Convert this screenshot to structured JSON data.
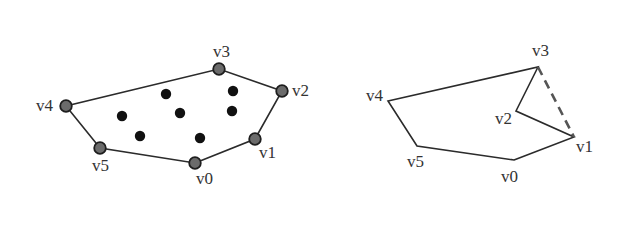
{
  "colors": {
    "edge": "#2b2b2b",
    "vertex_fill": "#6b6b6b",
    "vertex_stroke": "#1e1e1e",
    "interior_point": "#111111",
    "label": "#333333"
  },
  "left_polygon": {
    "vertices": [
      {
        "label": "v0",
        "x": 195,
        "y": 163,
        "lx": 196,
        "ly": 184
      },
      {
        "label": "v1",
        "x": 255,
        "y": 139,
        "lx": 259,
        "ly": 158
      },
      {
        "label": "v2",
        "x": 282,
        "y": 91,
        "lx": 292,
        "ly": 96
      },
      {
        "label": "v3",
        "x": 219,
        "y": 69,
        "lx": 213,
        "ly": 57
      },
      {
        "label": "v4",
        "x": 66,
        "y": 106,
        "lx": 36,
        "ly": 111
      },
      {
        "label": "v5",
        "x": 100,
        "y": 148,
        "lx": 92,
        "ly": 171
      }
    ],
    "interior_points": [
      {
        "x": 166,
        "y": 94
      },
      {
        "x": 233,
        "y": 91
      },
      {
        "x": 122,
        "y": 116
      },
      {
        "x": 180,
        "y": 113
      },
      {
        "x": 232,
        "y": 111
      },
      {
        "x": 140,
        "y": 136
      },
      {
        "x": 200,
        "y": 138
      }
    ]
  },
  "right_polygon": {
    "vertices": [
      {
        "label": "v0",
        "x": 514,
        "y": 160,
        "lx": 501,
        "ly": 182
      },
      {
        "label": "v1",
        "x": 574,
        "y": 137,
        "lx": 576,
        "ly": 152
      },
      {
        "label": "v2",
        "x": 516,
        "y": 111,
        "lx": 495,
        "ly": 124
      },
      {
        "label": "v3",
        "x": 538,
        "y": 67,
        "lx": 532,
        "ly": 56
      },
      {
        "label": "v4",
        "x": 388,
        "y": 101,
        "lx": 366,
        "ly": 101
      },
      {
        "label": "v5",
        "x": 417,
        "y": 146,
        "lx": 407,
        "ly": 167
      }
    ],
    "dashed_edge": {
      "from": "v3",
      "to": "v1"
    }
  }
}
